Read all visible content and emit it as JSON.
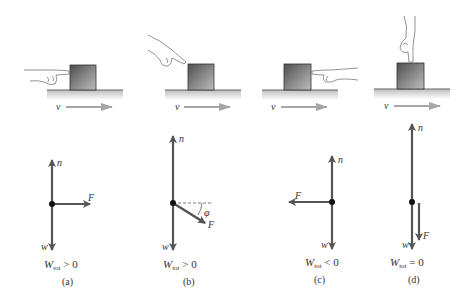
{
  "figure": {
    "colors": {
      "vector": "#555555",
      "velocity_arrow": "#a9a9a9",
      "ground": "#c8c8c8",
      "block_dark": "#5a5a5a",
      "block_light": "#b4b4b4",
      "text": "#333333"
    },
    "panels": [
      {
        "id": "a",
        "caption": "(a)",
        "hand_direction": "from-left",
        "velocity_label": "v",
        "vectors": {
          "normal": "n",
          "weight": "w",
          "force": "F"
        },
        "force_direction": "right (parallel to v)",
        "work_label_main": "W",
        "work_label_sub": "tot",
        "work_relation": " > 0"
      },
      {
        "id": "b",
        "caption": "(b)",
        "hand_direction": "from-upper-left",
        "velocity_label": "v",
        "vectors": {
          "normal": "n",
          "weight": "w",
          "force": "F"
        },
        "force_direction": "down-right at angle phi below horizontal",
        "angle_label": "φ",
        "work_label_main": "W",
        "work_label_sub": "tot",
        "work_relation": " > 0"
      },
      {
        "id": "c",
        "caption": "(c)",
        "hand_direction": "from-right",
        "velocity_label": "v",
        "vectors": {
          "normal": "n",
          "weight": "w",
          "force": "F"
        },
        "force_direction": "left (opposite to v)",
        "work_label_main": "W",
        "work_label_sub": "tot",
        "work_relation": " < 0"
      },
      {
        "id": "d",
        "caption": "(d)",
        "hand_direction": "from-above",
        "velocity_label": "v",
        "vectors": {
          "normal": "n",
          "weight": "w",
          "force": "F"
        },
        "force_direction": "down (perpendicular to v)",
        "work_label_main": "W",
        "work_label_sub": "tot",
        "work_relation": " = 0"
      }
    ]
  }
}
